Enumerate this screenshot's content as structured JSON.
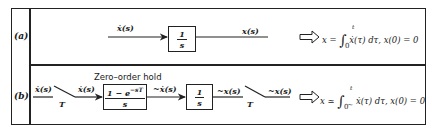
{
  "rows": [
    {
      "label": "(a)",
      "input_signal": "ẋ(s)",
      "block": {
        "numerator": "1",
        "denominator": "s"
      },
      "output_signal": "x(s)",
      "result": {
        "lhs": "x =",
        "integral": "∫",
        "upper": "t",
        "lower": "0",
        "integrand": "ẋ(τ) dτ,",
        "ic": "x(0) = 0"
      }
    },
    {
      "label": "(b)",
      "input_signal": "ẋ(s)",
      "sampler1_label": "T",
      "sampled_signal": "ẋ(s)",
      "zoh_title": "Zero–order hold",
      "zoh_block": {
        "numerator": "1 − e",
        "exponent": "−sT",
        "denominator": "s"
      },
      "zoh_output": "~ẋ(s)",
      "integrator_block": {
        "numerator": "1",
        "denominator": "s"
      },
      "integrator_output": "~x(s)",
      "sampler2_label": "T",
      "output_signal": "~x(s)",
      "result": {
        "lhs": "x ≃",
        "integral": "∫",
        "upper": "t",
        "lower": "0",
        "tilde": "~",
        "integrand": "ẋ(τ) dτ,",
        "ic": "x(0) = 0"
      }
    }
  ],
  "icons": {
    "implies_arrow": "hollow-right-arrow",
    "sampler_switch": "switch-open"
  },
  "colors": {
    "ink": "#1a1a1a",
    "background": "#ffffff"
  }
}
